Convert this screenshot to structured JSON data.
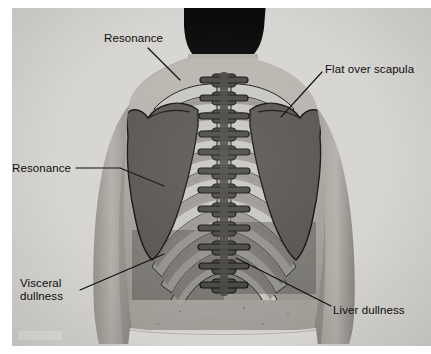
{
  "figure": {
    "kind": "medical-illustration",
    "view": "back of torso, arms at sides"
  },
  "palette": {
    "plate_background": "#d5d3cf",
    "skin_light": "#bcb9b3",
    "skin_mid": "#a7a49e",
    "skin_shadow": "#8c8984",
    "hair_black": "#0b0b0b",
    "waistband": "#dedcd6",
    "rib_light": "#c9c7c2",
    "rib_mid": "#9b9893",
    "vertebra_dark": "#4a4845",
    "scapula_dark": "#595651",
    "dullness_band": "#6f6c67",
    "outline": "#141414",
    "label_text": "#0d0d0d",
    "leader_line": "#0d0d0d"
  },
  "labels": [
    {
      "id": "resonance-upper",
      "text": "Resonance",
      "lines": [
        "Resonance"
      ],
      "x": 104,
      "y": 32,
      "leader": {
        "from": [
          148,
          48
        ],
        "to": [
          178,
          78
        ]
      },
      "points_to": "upper lung field, left of spine"
    },
    {
      "id": "flat-over-scapula",
      "text": "Flat over scapula",
      "lines": [
        "Flat over scapula"
      ],
      "x": 325,
      "y": 63,
      "leader": {
        "from": [
          322,
          72
        ],
        "to": [
          281,
          117
        ]
      },
      "points_to": "right scapula"
    },
    {
      "id": "resonance-lower",
      "text": "Resonance",
      "lines": [
        "Resonance"
      ],
      "x": 12,
      "y": 162,
      "leader": {
        "from": [
          76,
          168
        ],
        "to": [
          152,
          185
        ]
      },
      "points_to": "mid lung field"
    },
    {
      "id": "visceral-dullness",
      "text": "Visceral dullness",
      "lines": [
        "Visceral",
        "dullness"
      ],
      "x": 20,
      "y": 277,
      "leader": {
        "from": [
          80,
          288
        ],
        "to": [
          152,
          256
        ]
      },
      "points_to": "lower left thorax, visceral region"
    },
    {
      "id": "liver-dullness",
      "text": "Liver dullness",
      "lines": [
        "Liver dullness"
      ],
      "x": 333,
      "y": 304,
      "leader": {
        "from": [
          331,
          305
        ],
        "to": [
          236,
          258
        ]
      },
      "points_to": "lower right thorax over liver"
    }
  ],
  "anatomy": {
    "spine": {
      "name": "thoracic vertebral column",
      "vertebra_count": 12,
      "top_y": 66,
      "bottom_y": 290,
      "center_x": 212
    },
    "ribs": {
      "name": "rib cage",
      "pairs": 11,
      "style": "alternating light and mid gray bands with dark outline"
    },
    "scapulae": [
      {
        "side": "left",
        "label": "left scapula"
      },
      {
        "side": "right",
        "label": "right scapula"
      }
    ],
    "percussion_zones": [
      {
        "zone": "resonance",
        "tone": "resonant",
        "region": "upper and mid lung fields"
      },
      {
        "zone": "flat",
        "tone": "flat",
        "region": "over scapula"
      },
      {
        "zone": "visceral dullness",
        "tone": "dull",
        "region": "lower left thorax"
      },
      {
        "zone": "liver dullness",
        "tone": "dull",
        "region": "lower right thorax"
      }
    ]
  }
}
